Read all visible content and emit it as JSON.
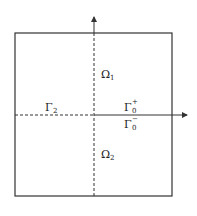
{
  "diagram": {
    "type": "domain-decomposition",
    "colors": {
      "line": "#333333",
      "background": "#ffffff"
    },
    "regions": [
      {
        "id": "omega1",
        "base": "Ω",
        "subscript": "1"
      },
      {
        "id": "omega2",
        "base": "Ω",
        "subscript": "2"
      }
    ],
    "boundaries": [
      {
        "id": "gamma2",
        "base": "Γ",
        "subscript": "2",
        "superscript": ""
      },
      {
        "id": "gamma0plus",
        "base": "Γ",
        "subscript": "0",
        "superscript": "+"
      },
      {
        "id": "gamma0minus",
        "base": "Γ",
        "subscript": "0",
        "superscript": "−"
      }
    ]
  }
}
